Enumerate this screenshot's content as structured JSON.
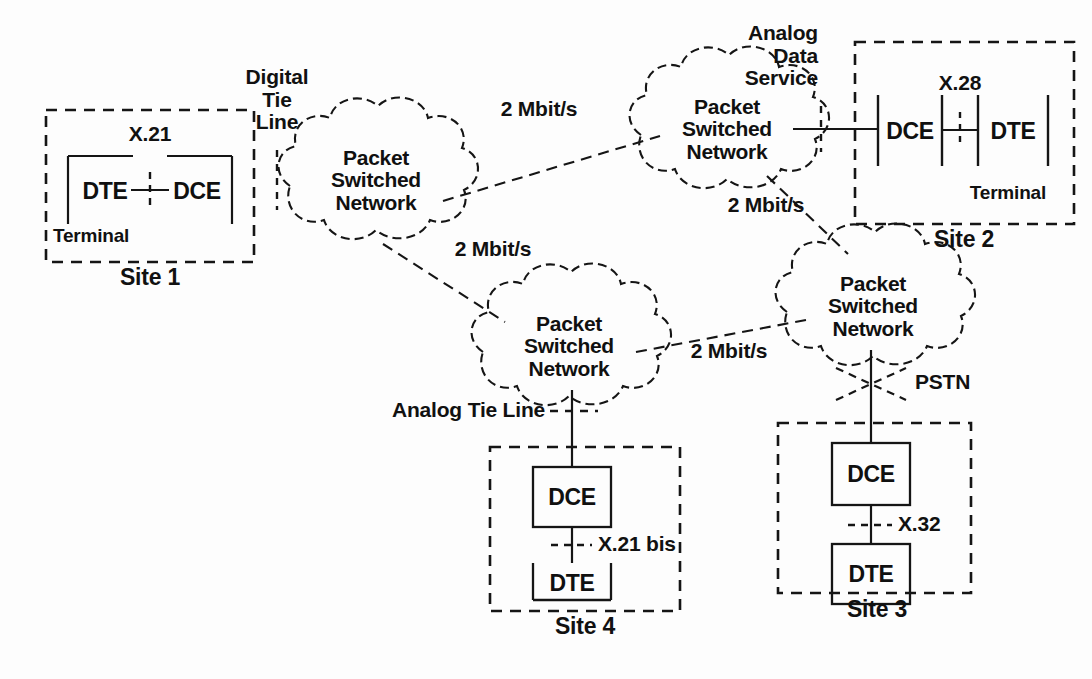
{
  "diagram": {
    "colors": {
      "ink": "#111111",
      "background": "#fdfdfd"
    },
    "clouds": [
      {
        "id": "cloud-west",
        "label": "Packet\nSwitched\nNetwork",
        "cx": 376,
        "cy": 180
      },
      {
        "id": "cloud-north",
        "label": "Packet\nSwitched\nNetwork",
        "cx": 727,
        "cy": 129
      },
      {
        "id": "cloud-south",
        "label": "Packet\nSwitched\nNetwork",
        "cx": 569,
        "cy": 346
      },
      {
        "id": "cloud-east",
        "label": "Packet\nSwitched\nNetwork",
        "cx": 873,
        "cy": 306
      }
    ],
    "links": [
      {
        "id": "link-west-north",
        "label": "2 Mbit/s",
        "rate": "2 Mbit/s"
      },
      {
        "id": "link-west-south",
        "label": "2 Mbit/s",
        "rate": "2 Mbit/s"
      },
      {
        "id": "link-north-east",
        "label": "2 Mbit/s",
        "rate": "2 Mbit/s"
      },
      {
        "id": "link-south-east",
        "label": "2 Mbit/s",
        "rate": "2 Mbit/s"
      }
    ],
    "annotations": {
      "digital_tie_line": "Digital\nTie\nLine",
      "analog_data_service": "Analog\nData\nService",
      "analog_tie_line": "Analog Tie Line",
      "pstn": "PSTN"
    },
    "sites": [
      {
        "id": "site-1",
        "name": "Site 1",
        "interface": "X.21",
        "enclosure": "Terminal",
        "devices": [
          "DTE",
          "DCE"
        ]
      },
      {
        "id": "site-2",
        "name": "Site 2",
        "interface": "X.28",
        "enclosure": "Terminal",
        "devices": [
          "DCE",
          "DTE"
        ]
      },
      {
        "id": "site-3",
        "name": "Site 3",
        "interface": "X.32",
        "devices": [
          "DCE",
          "DTE"
        ]
      },
      {
        "id": "site-4",
        "name": "Site 4",
        "interface": "X.21 bis",
        "devices": [
          "DCE",
          "DTE"
        ]
      }
    ]
  }
}
